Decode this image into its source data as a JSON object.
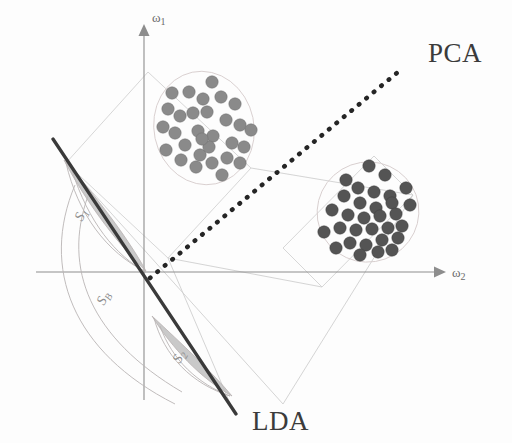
{
  "figure": {
    "title_text": "PCA vs LDA projection directions for two Gaussian clusters",
    "background_color": "#fdfdfd"
  },
  "labels": {
    "pca": "PCA",
    "lda": "LDA",
    "axis_y": "ω",
    "axis_y_sub": "1",
    "axis_x": "ω",
    "axis_x_sub": "2",
    "scatter_within_1": "S",
    "scatter_within_1_sub": "1",
    "scatter_within_2": "S",
    "scatter_within_2_sub": "2",
    "scatter_between": "S",
    "scatter_between_sub": "B"
  },
  "colors": {
    "cluster_a_fill": "#8a8a8a",
    "cluster_b_fill": "#545454",
    "lda_line": "#3a3a3a",
    "pca_line": "#252525",
    "axis": "#8d8d8d",
    "projection_guides": "#cfcfcf",
    "lens_fill": "#bdbdbd",
    "label_text": "#3b3b3b"
  },
  "chart_data": {
    "type": "scatter",
    "title": "",
    "xlabel": "ω₂",
    "ylabel": "ω₁",
    "grid": false,
    "legend_position": "none",
    "annotations": [
      {
        "name": "pca-axis-label",
        "text": "PCA",
        "x": 430,
        "y": 55
      },
      {
        "name": "lda-axis-label",
        "text": "LDA",
        "x": 253,
        "y": 424
      },
      {
        "name": "within-scatter-1",
        "text": "S1",
        "x": 86,
        "y": 218
      },
      {
        "name": "within-scatter-2",
        "text": "S2",
        "x": 184,
        "y": 360
      },
      {
        "name": "between-scatter",
        "text": "SB",
        "x": 110,
        "y": 303
      }
    ],
    "axes": {
      "origin": [
        144,
        272
      ],
      "x_axis": {
        "from": [
          36,
          272
        ],
        "to": [
          438,
          272
        ],
        "arrow": "right"
      },
      "y_axis": {
        "from": [
          144,
          395
        ],
        "to": [
          144,
          30
        ],
        "arrow": "up"
      }
    },
    "projection_lines": [
      {
        "name": "pca-direction",
        "from": [
          148,
          277
        ],
        "to": [
          396,
          73
        ],
        "style": "dotted",
        "label": "PCA"
      },
      {
        "name": "lda-direction",
        "from": [
          53,
          139
        ],
        "to": [
          232,
          408
        ],
        "style": "solid-thick",
        "label": "LDA"
      }
    ],
    "series": [
      {
        "name": "cluster-a",
        "color": "#8a8a8a",
        "radius": 6.2,
        "count": 30,
        "points": [
          [
            180,
            116
          ],
          [
            203,
            99
          ],
          [
            212,
            82
          ],
          [
            189,
            92
          ],
          [
            198,
            131
          ],
          [
            168,
            109
          ],
          [
            175,
            133
          ],
          [
            193,
            113
          ],
          [
            163,
            127
          ],
          [
            207,
            112
          ],
          [
            185,
            145
          ],
          [
            200,
            155
          ],
          [
            213,
            136
          ],
          [
            226,
            120
          ],
          [
            235,
            104
          ],
          [
            221,
            97
          ],
          [
            240,
            125
          ],
          [
            232,
            143
          ],
          [
            209,
            147
          ],
          [
            196,
            167
          ],
          [
            181,
            160
          ],
          [
            166,
            150
          ],
          [
            212,
            163
          ],
          [
            227,
            158
          ],
          [
            244,
            147
          ],
          [
            251,
            130
          ],
          [
            172,
            93
          ],
          [
            240,
            163
          ],
          [
            222,
            175
          ],
          [
            202,
            139
          ]
        ]
      },
      {
        "name": "cluster-b",
        "color": "#545454",
        "radius": 6.2,
        "count": 31,
        "points": [
          [
            369,
            166
          ],
          [
            385,
            175
          ],
          [
            358,
            188
          ],
          [
            374,
            192
          ],
          [
            390,
            196
          ],
          [
            344,
            196
          ],
          [
            360,
            203
          ],
          [
            376,
            208
          ],
          [
            392,
            203
          ],
          [
            406,
            188
          ],
          [
            332,
            210
          ],
          [
            348,
            215
          ],
          [
            364,
            218
          ],
          [
            380,
            216
          ],
          [
            396,
            214
          ],
          [
            410,
            205
          ],
          [
            340,
            228
          ],
          [
            356,
            230
          ],
          [
            372,
            229
          ],
          [
            388,
            228
          ],
          [
            402,
            226
          ],
          [
            324,
            232
          ],
          [
            350,
            243
          ],
          [
            366,
            245
          ],
          [
            382,
            240
          ],
          [
            398,
            238
          ],
          [
            336,
            248
          ],
          [
            360,
            255
          ],
          [
            378,
            252
          ],
          [
            392,
            250
          ],
          [
            346,
            180
          ]
        ]
      }
    ],
    "cluster_hulls": [
      {
        "name": "cluster-a-ellipse",
        "cx": 204,
        "cy": 128,
        "rx": 50,
        "ry": 57,
        "rotation": -12
      },
      {
        "name": "cluster-b-ellipse",
        "cx": 368,
        "cy": 212,
        "rx": 51,
        "ry": 50,
        "rotation": -20
      }
    ],
    "bounding_boxes": [
      {
        "name": "cluster-a-bbox",
        "points": [
          [
            66,
            163
          ],
          [
            148,
            72
          ],
          [
            251,
            168
          ],
          [
            168,
            258
          ]
        ]
      },
      {
        "name": "cluster-b-bbox",
        "points": [
          [
            283,
            248
          ],
          [
            374,
            156
          ],
          [
            413,
            195
          ],
          [
            322,
            287
          ]
        ]
      }
    ]
  }
}
